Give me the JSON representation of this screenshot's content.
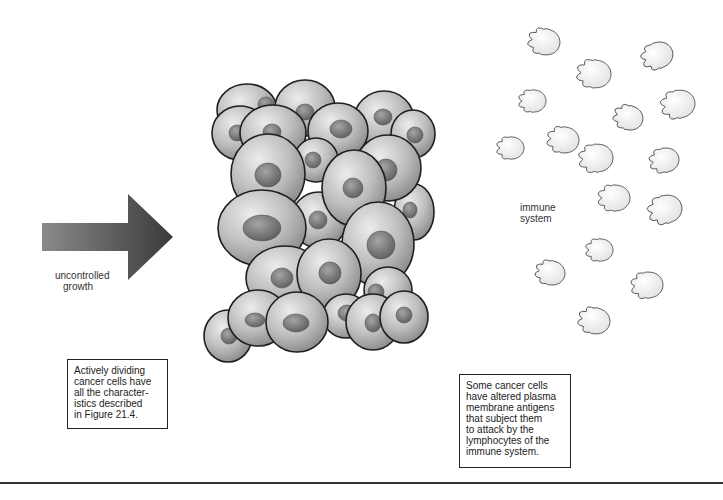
{
  "figure": {
    "arrow_label_lines": [
      "uncontrolled",
      "growth"
    ],
    "immune_label_lines": [
      "immune",
      "system"
    ],
    "left_caption_lines": [
      "Actively dividing",
      "cancer cells have",
      "all the character-",
      "istics described",
      "in Figure 21.4."
    ],
    "right_caption_lines": [
      "Some cancer cells",
      "have altered plasma",
      "membrane antigens",
      "that subject them",
      "to attack by the",
      "lymphocytes of the",
      "immune system."
    ]
  },
  "colors": {
    "background": "#ffffff",
    "cell_fill_light": "#e6e6e6",
    "cell_fill_dark": "#8f8f8f",
    "nucleus_fill": "#7a7a7a",
    "outline": "#1f1f1f",
    "arrow_dark": "#3a3a3a",
    "arrow_light": "#8a8a8a",
    "lymphocyte_fill": "#f4f4f4",
    "lymphocyte_outline": "#555555"
  },
  "cancer_cells": [
    {
      "cx": 247,
      "cy": 110,
      "rx": 30,
      "ry": 26,
      "nx": 266,
      "ny": 104,
      "nrx": 8,
      "nry": 7
    },
    {
      "cx": 240,
      "cy": 133,
      "rx": 28,
      "ry": 27,
      "nx": 237,
      "ny": 133,
      "nrx": 8,
      "nry": 8
    },
    {
      "cx": 305,
      "cy": 108,
      "rx": 30,
      "ry": 28,
      "nx": 305,
      "ny": 112,
      "nrx": 9,
      "nry": 8
    },
    {
      "cx": 384,
      "cy": 120,
      "rx": 30,
      "ry": 29,
      "nx": 383,
      "ny": 117,
      "nrx": 9,
      "nry": 8
    },
    {
      "cx": 413,
      "cy": 134,
      "rx": 22,
      "ry": 24,
      "nx": 415,
      "ny": 135,
      "nrx": 8,
      "nry": 8
    },
    {
      "cx": 273,
      "cy": 133,
      "rx": 33,
      "ry": 28,
      "nx": 272,
      "ny": 132,
      "nrx": 9,
      "nry": 8
    },
    {
      "cx": 338,
      "cy": 131,
      "rx": 30,
      "ry": 28,
      "nx": 341,
      "ny": 129,
      "nrx": 11,
      "nry": 9
    },
    {
      "cx": 316,
      "cy": 160,
      "rx": 22,
      "ry": 22,
      "nx": 313,
      "ny": 160,
      "nrx": 8,
      "nry": 8
    },
    {
      "cx": 414,
      "cy": 212,
      "rx": 20,
      "ry": 28,
      "nx": 410,
      "ny": 210,
      "nrx": 7,
      "nry": 8
    },
    {
      "cx": 388,
      "cy": 168,
      "rx": 33,
      "ry": 33,
      "nx": 386,
      "ny": 170,
      "nrx": 11,
      "nry": 11
    },
    {
      "cx": 268,
      "cy": 174,
      "rx": 37,
      "ry": 40,
      "nx": 268,
      "ny": 175,
      "nrx": 13,
      "nry": 12
    },
    {
      "cx": 319,
      "cy": 220,
      "rx": 28,
      "ry": 28,
      "nx": 318,
      "ny": 220,
      "nrx": 9,
      "nry": 9
    },
    {
      "cx": 354,
      "cy": 188,
      "rx": 32,
      "ry": 38,
      "nx": 353,
      "ny": 188,
      "nrx": 10,
      "nry": 10
    },
    {
      "cx": 262,
      "cy": 228,
      "rx": 44,
      "ry": 38,
      "nx": 262,
      "ny": 228,
      "nrx": 19,
      "nry": 13
    },
    {
      "cx": 378,
      "cy": 244,
      "rx": 36,
      "ry": 42,
      "nx": 381,
      "ny": 245,
      "nrx": 14,
      "nry": 14
    },
    {
      "cx": 388,
      "cy": 290,
      "rx": 24,
      "ry": 23,
      "nx": 376,
      "ny": 292,
      "nrx": 8,
      "nry": 8
    },
    {
      "cx": 285,
      "cy": 278,
      "rx": 39,
      "ry": 32,
      "nx": 282,
      "ny": 278,
      "nrx": 11,
      "nry": 10
    },
    {
      "cx": 329,
      "cy": 274,
      "rx": 32,
      "ry": 35,
      "nx": 330,
      "ny": 273,
      "nrx": 11,
      "nry": 11
    },
    {
      "cx": 346,
      "cy": 316,
      "rx": 23,
      "ry": 22,
      "nx": 347,
      "ny": 313,
      "nrx": 9,
      "nry": 8
    },
    {
      "cx": 373,
      "cy": 322,
      "rx": 27,
      "ry": 28,
      "nx": 373,
      "ny": 323,
      "nrx": 8,
      "nry": 9
    },
    {
      "cx": 404,
      "cy": 317,
      "rx": 24,
      "ry": 26,
      "nx": 404,
      "ny": 315,
      "nrx": 8,
      "nry": 8
    },
    {
      "cx": 228,
      "cy": 336,
      "rx": 24,
      "ry": 26,
      "nx": 229,
      "ny": 336,
      "nrx": 8,
      "nry": 8
    },
    {
      "cx": 258,
      "cy": 318,
      "rx": 30,
      "ry": 28,
      "nx": 255,
      "ny": 320,
      "nrx": 10,
      "nry": 7
    },
    {
      "cx": 297,
      "cy": 322,
      "rx": 31,
      "ry": 30,
      "nx": 296,
      "ny": 323,
      "nrx": 13,
      "nry": 9
    }
  ],
  "lymphocytes": [
    {
      "x": 546,
      "y": 42,
      "r": 14,
      "angle": 10
    },
    {
      "x": 659,
      "y": 55,
      "r": 14,
      "angle": -20
    },
    {
      "x": 596,
      "y": 74,
      "r": 15,
      "angle": 5
    },
    {
      "x": 534,
      "y": 101,
      "r": 12,
      "angle": 0
    },
    {
      "x": 630,
      "y": 118,
      "r": 13,
      "angle": 15
    },
    {
      "x": 680,
      "y": 104,
      "r": 15,
      "angle": -10
    },
    {
      "x": 565,
      "y": 140,
      "r": 14,
      "angle": 5
    },
    {
      "x": 512,
      "y": 148,
      "r": 12,
      "angle": 0
    },
    {
      "x": 598,
      "y": 158,
      "r": 15,
      "angle": -5
    },
    {
      "x": 666,
      "y": 160,
      "r": 13,
      "angle": -10
    },
    {
      "x": 616,
      "y": 198,
      "r": 14,
      "angle": 0
    },
    {
      "x": 667,
      "y": 209,
      "r": 15,
      "angle": -15
    },
    {
      "x": 601,
      "y": 250,
      "r": 12,
      "angle": 0
    },
    {
      "x": 552,
      "y": 273,
      "r": 13,
      "angle": 10
    },
    {
      "x": 649,
      "y": 285,
      "r": 14,
      "angle": -5
    },
    {
      "x": 596,
      "y": 321,
      "r": 14,
      "angle": 10
    }
  ]
}
